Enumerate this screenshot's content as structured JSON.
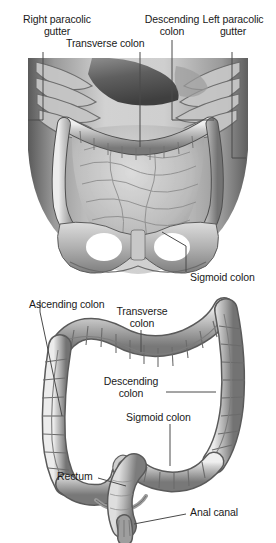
{
  "figure": {
    "type": "medical-illustration",
    "palette": {
      "background": "#ffffff",
      "label_text": "#1a1a1a",
      "leader_line": "#4a4a4a",
      "tissue_light": "#d8d8d8",
      "tissue_mid": "#a8a8a8",
      "tissue_dark": "#6e6e6e",
      "tissue_shadow": "#4c4c4c",
      "outline": "#3a3a3a"
    }
  },
  "upper_panel": {
    "name": "abdominal-cavity-view",
    "labels": [
      {
        "id": "right-paracolic-gutter",
        "line1": "Right paracolic",
        "line2": "gutter"
      },
      {
        "id": "transverse-colon",
        "line1": "Transverse colon",
        "line2": ""
      },
      {
        "id": "descending-colon",
        "line1": "Descending",
        "line2": "colon"
      },
      {
        "id": "left-paracolic-gutter",
        "line1": "Left paracolic",
        "line2": "gutter"
      },
      {
        "id": "sigmoid-colon",
        "line1": "Sigmoid colon",
        "line2": ""
      }
    ]
  },
  "lower_panel": {
    "name": "isolated-large-intestine-view",
    "labels": [
      {
        "id": "ascending-colon",
        "line1": "Ascending colon",
        "line2": ""
      },
      {
        "id": "transverse-colon",
        "line1": "Transverse",
        "line2": "colon"
      },
      {
        "id": "descending-colon",
        "line1": "Descending",
        "line2": "colon"
      },
      {
        "id": "sigmoid-colon",
        "line1": "Sigmoid colon",
        "line2": ""
      },
      {
        "id": "rectum",
        "line1": "Rectum",
        "line2": ""
      },
      {
        "id": "anal-canal",
        "line1": "Anal canal",
        "line2": ""
      }
    ]
  }
}
